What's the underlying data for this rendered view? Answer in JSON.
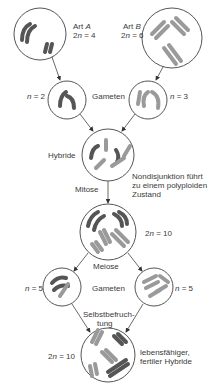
{
  "species_a": {
    "name": "Art",
    "letter": "A",
    "ploidy_prefix": "2",
    "ploidy_var": "n",
    "ploidy_suffix": " = 4"
  },
  "species_b": {
    "name": "Art",
    "letter": "B",
    "ploidy_prefix": "2",
    "ploidy_var": "n",
    "ploidy_suffix": " = 6"
  },
  "gamete_a": {
    "var": "n",
    "suffix": " = 2"
  },
  "gamete_b": {
    "var": "n",
    "suffix": " = 3"
  },
  "gametes_label_1": "Gameten",
  "hybrid_label": "Hybride",
  "mitosis_label": "Mitose",
  "nondisjunction_note": "Nondisjunktion führt zu einem polyploiden Zustand",
  "polyploid": {
    "prefix": "2",
    "var": "n",
    "suffix": " = 10"
  },
  "meiosis_label": "Meiose",
  "gamete_left": {
    "var": "n",
    "suffix": " = 5"
  },
  "gamete_right": {
    "var": "n",
    "suffix": " = 5"
  },
  "gametes_label_2": "Gameten",
  "selfing_label_1": "Selbstbefruch-",
  "selfing_label_2": "tung",
  "final": {
    "prefix": "2",
    "var": "n",
    "suffix": " = 10"
  },
  "final_note_1": "lebensfähiger,",
  "final_note_2": "fertiler Hybride",
  "colors": {
    "dark": "#555555",
    "light": "#9a9a9a",
    "line": "#444444"
  }
}
